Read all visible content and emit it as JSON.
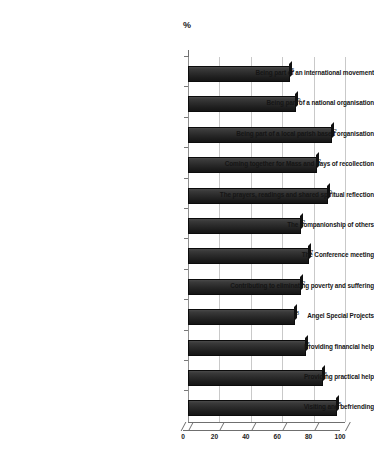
{
  "chart": {
    "title": "%",
    "axis_title_top": "%"
  },
  "chart_data": {
    "type": "bar",
    "orientation": "horizontal",
    "title": "%",
    "xlabel": "%",
    "ylabel": "",
    "xlim": [
      0,
      100
    ],
    "xticks": [
      "0",
      "20",
      "40",
      "60",
      "80",
      "100"
    ],
    "grid": true,
    "legend": false,
    "categories": [
      "Being part of an international movement",
      "Being part of a  national organisation",
      "Being part of a local parish based organisation",
      "Coming together for Mass and days of recollection",
      "The prayers, readings and shared spiritual reflection",
      "The companionship of others",
      "The Conference meeting",
      "Contributing to eliminating poverty and suffering",
      "Angel Special Projects",
      "Providing financial help",
      "Providing practical help",
      "Visiting and befriending"
    ],
    "values": [
      65,
      69,
      92,
      82,
      89,
      72,
      77,
      72,
      68,
      75,
      86,
      95
    ],
    "value_labels": [
      "5",
      "9",
      "2",
      "2",
      "9",
      "2",
      "7",
      "2",
      "8",
      "5",
      "6",
      "5"
    ],
    "bar_color": "#2b2b2b"
  }
}
